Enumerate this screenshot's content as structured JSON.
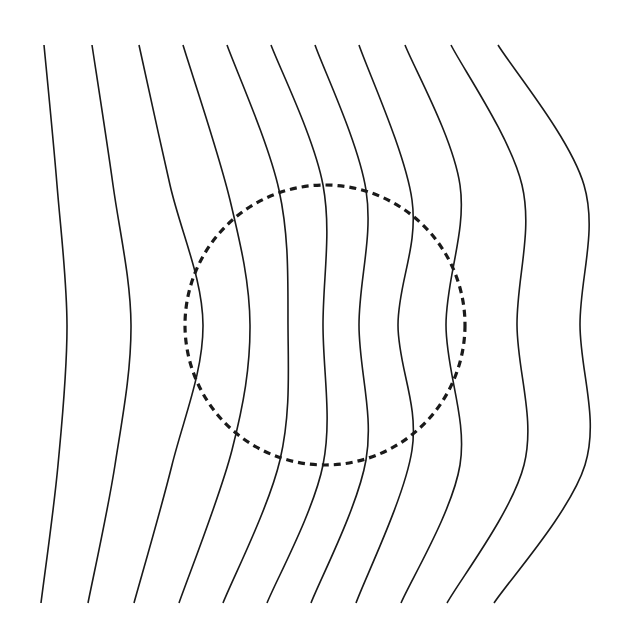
{
  "diagram": {
    "title": "",
    "colors": {
      "background": "#ffffff",
      "field_line": "#1a1a1a",
      "boundary": "#1a1a1a"
    },
    "boundary": {
      "shape": "circle",
      "style": "dashed",
      "cx": 325,
      "cy": 325,
      "r": 140
    },
    "field_lines": [
      {
        "id": 1,
        "top": [
          44,
          45
        ],
        "upper": [
          57,
          185
        ],
        "mid": [
          67,
          325
        ],
        "lower": [
          58,
          465
        ],
        "bottom": [
          41,
          603
        ]
      },
      {
        "id": 2,
        "top": [
          92,
          45
        ],
        "upper": [
          113,
          185
        ],
        "mid": [
          131,
          325
        ],
        "lower": [
          115,
          465
        ],
        "bottom": [
          88,
          603
        ]
      },
      {
        "id": 3,
        "top": [
          139,
          45
        ],
        "upper": [
          170,
          185
        ],
        "mid": [
          203,
          325
        ],
        "lower": [
          172,
          465
        ],
        "bottom": [
          134,
          603
        ]
      },
      {
        "id": 4,
        "top": [
          183,
          45
        ],
        "upper": [
          230,
          200
        ],
        "mid": [
          250,
          325
        ],
        "lower": [
          232,
          450
        ],
        "bottom": [
          179,
          603
        ]
      },
      {
        "id": 5,
        "top": [
          227,
          45
        ],
        "upper": [
          279,
          190
        ],
        "mid": [
          288,
          325
        ],
        "lower": [
          280,
          460
        ],
        "bottom": [
          223,
          603
        ]
      },
      {
        "id": 6,
        "top": [
          271,
          45
        ],
        "upper": [
          323,
          185
        ],
        "mid": [
          323,
          325
        ],
        "lower": [
          323,
          465
        ],
        "bottom": [
          267,
          603
        ]
      },
      {
        "id": 7,
        "top": [
          315,
          45
        ],
        "upper": [
          366,
          190
        ],
        "mid": [
          359,
          325
        ],
        "lower": [
          366,
          460
        ],
        "bottom": [
          311,
          603
        ]
      },
      {
        "id": 8,
        "top": [
          359,
          45
        ],
        "upper": [
          412,
          200
        ],
        "mid": [
          398,
          325
        ],
        "lower": [
          412,
          450
        ],
        "bottom": [
          356,
          603
        ]
      },
      {
        "id": 9,
        "top": [
          405,
          45
        ],
        "upper": [
          460,
          185
        ],
        "mid": [
          446,
          325
        ],
        "lower": [
          460,
          465
        ],
        "bottom": [
          401,
          603
        ]
      },
      {
        "id": 10,
        "top": [
          451,
          45
        ],
        "upper": [
          522,
          185
        ],
        "mid": [
          517,
          325
        ],
        "lower": [
          524,
          465
        ],
        "bottom": [
          447,
          603
        ]
      },
      {
        "id": 11,
        "top": [
          498,
          45
        ],
        "upper": [
          584,
          185
        ],
        "mid": [
          580,
          325
        ],
        "lower": [
          585,
          465
        ],
        "bottom": [
          494,
          603
        ]
      }
    ]
  }
}
